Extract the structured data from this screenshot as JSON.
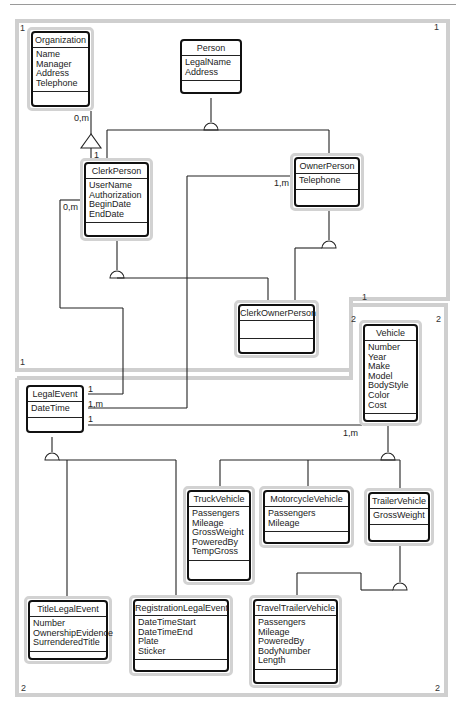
{
  "regions": [
    {
      "id": "region-1",
      "number": "1"
    },
    {
      "id": "region-2",
      "number": "2"
    }
  ],
  "entities": {
    "organization": {
      "name": "Organization",
      "attributes": [
        "Name",
        "Manager",
        "Address",
        "Telephone"
      ]
    },
    "person": {
      "name": "Person",
      "attributes": [
        "LegalName",
        "Address"
      ]
    },
    "clerk_person": {
      "name": "ClerkPerson",
      "attributes": [
        "UserName",
        "Authorization",
        "BeginDate",
        "EndDate"
      ]
    },
    "owner_person": {
      "name": "OwnerPerson",
      "attributes": [
        "Telephone"
      ]
    },
    "clerk_owner_person": {
      "name": "ClerkOwnerPerson",
      "attributes": []
    },
    "vehicle": {
      "name": "Vehicle",
      "attributes": [
        "Number",
        "Year",
        "Make",
        "Model",
        "BodyStyle",
        "Color",
        "Cost"
      ]
    },
    "legal_event": {
      "name": "LegalEvent",
      "attributes": [
        "DateTime"
      ]
    },
    "truck_vehicle": {
      "name": "TruckVehicle",
      "attributes": [
        "Passengers",
        "Mileage",
        "GrossWeight",
        "PoweredBy",
        "TempGross"
      ]
    },
    "motorcycle_vehicle": {
      "name": "MotorcycleVehicle",
      "attributes": [
        "Passengers",
        "Mileage"
      ]
    },
    "trailer_vehicle": {
      "name": "TrailerVehicle",
      "attributes": [
        "GrossWeight"
      ]
    },
    "title_legal_event": {
      "name": "TitleLegalEvent",
      "attributes": [
        "Number",
        "OwnershipEvidence",
        "SurrenderedTitle"
      ]
    },
    "registration_legal_event": {
      "name": "RegistrationLegalEvent",
      "attributes": [
        "DateTimeStart",
        "DateTimeEnd",
        "Plate",
        "Sticker"
      ]
    },
    "travel_trailer_vehicle": {
      "name": "TravelTrailerVehicle",
      "attributes": [
        "Passengers",
        "Mileage",
        "PoweredBy",
        "BodyNumber",
        "Length"
      ]
    }
  },
  "multiplicities": {
    "org_many": "0,m",
    "org_clerk_one": "1",
    "clerk_legal_many": "0,m",
    "owner_legal_many": "1,m",
    "legal_clerk_one": "1",
    "legal_owner_many": "1,m",
    "legal_vehicle_one": "1",
    "vehicle_legal_many": "1,m"
  },
  "region_labels": {
    "r1_top_left": "1",
    "r1_top_right": "1",
    "r1_bottom_left": "1",
    "r1_bottom_right": "1",
    "r2_top_left": "2",
    "r2_top_right": "2",
    "r2_bottom_left": "2",
    "r2_bottom_right": "2"
  }
}
